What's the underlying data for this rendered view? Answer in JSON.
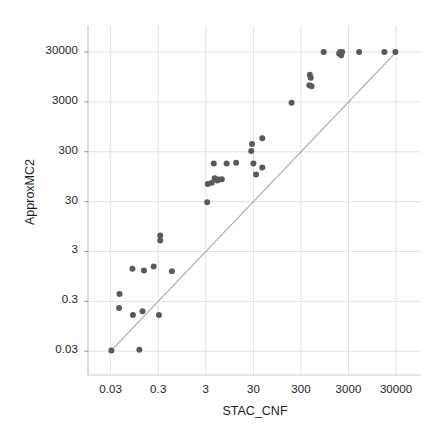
{
  "chart_data": {
    "type": "scatter",
    "title": "",
    "xlabel": "STAC_CNF",
    "ylabel": "ApproxMC2",
    "xscale": "log",
    "yscale": "log",
    "xlim": [
      0.01,
      100000
    ],
    "ylim": [
      0.01,
      100000
    ],
    "xticks": [
      0.03,
      0.3,
      3,
      30,
      300,
      3000,
      30000
    ],
    "xtick_labels": [
      "0.03",
      "0.3",
      "3",
      "30",
      "300",
      "3000",
      "30000"
    ],
    "yticks": [
      0.03,
      0.3,
      3,
      30,
      300,
      3000,
      30000
    ],
    "ytick_labels": [
      "0.03",
      "0.3",
      "3",
      "30",
      "300",
      "3000",
      "30000"
    ],
    "grid": true,
    "legend": "none",
    "marker_color": "#5a5a5a",
    "marker_size": 6,
    "reference_line": {
      "name": "y = x diagonal",
      "color": "#a8a8a8",
      "from": [
        0.03,
        0.03
      ],
      "to": [
        30000,
        30000
      ]
    },
    "series": [
      {
        "name": "instances",
        "points": [
          [
            0.031,
            0.031
          ],
          [
            0.12,
            0.032
          ],
          [
            0.045,
            0.22
          ],
          [
            0.046,
            0.42
          ],
          [
            0.088,
            0.16
          ],
          [
            0.14,
            0.19
          ],
          [
            0.31,
            0.16
          ],
          [
            0.086,
            1.35
          ],
          [
            0.15,
            1.25
          ],
          [
            0.24,
            1.5
          ],
          [
            0.58,
            1.2
          ],
          [
            0.33,
            5.0
          ],
          [
            0.33,
            6.3
          ],
          [
            3.2,
            29.0
          ],
          [
            3.3,
            68.0
          ],
          [
            4.0,
            72.0
          ],
          [
            4.6,
            88.0
          ],
          [
            5.2,
            80.0
          ],
          [
            5.6,
            83.0
          ],
          [
            6.5,
            84.0
          ],
          [
            4.4,
            175.0
          ],
          [
            8.2,
            175.0
          ],
          [
            13.0,
            180.0
          ],
          [
            30.0,
            175.0
          ],
          [
            27.0,
            310.0
          ],
          [
            28.0,
            430.0
          ],
          [
            34.0,
            105.0
          ],
          [
            46.0,
            560.0
          ],
          [
            46.0,
            145.0
          ],
          [
            190.0,
            2900.0
          ],
          [
            460.0,
            10500.0
          ],
          [
            480.0,
            9200.0
          ],
          [
            450.0,
            6500.0
          ],
          [
            500.0,
            6200.0
          ],
          [
            900.0,
            30000.0
          ],
          [
            1900.0,
            28000.0
          ],
          [
            2000.0,
            30000.0
          ],
          [
            2100.0,
            26000.0
          ],
          [
            2200.0,
            30000.0
          ],
          [
            5000.0,
            30000.0
          ],
          [
            17000.0,
            30000.0
          ],
          [
            29000.0,
            30000.0
          ]
        ]
      }
    ]
  },
  "axis": {
    "x_title": "STAC_CNF",
    "y_title": "ApproxMC2"
  }
}
